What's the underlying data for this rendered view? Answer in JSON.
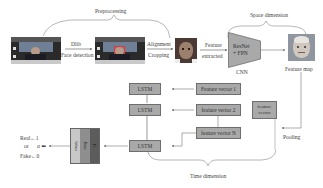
{
  "sections": {
    "preprocessing": "Preprocessing",
    "space_dimension": "Space dimension",
    "time_dimension": "Time dimension"
  },
  "steps": {
    "dlib_top": "Dlib",
    "dlib_bottom": "Face detection",
    "align_top": "Alignment",
    "align_bottom": "Cropping",
    "feature_top": "Feature",
    "feature_bottom": "extracted",
    "cnn_line1": "ResNet",
    "cnn_line2": "+ FPN",
    "cnn_label": "CNN",
    "feature_map": "Feature map",
    "pooling": "Pooling",
    "feature_vector": "feature vector"
  },
  "lstm": {
    "cells": [
      "LSTM",
      "LSTM",
      "LSTM"
    ]
  },
  "vectors": [
    "Feature vector 1",
    "feature vector 2",
    "feature vector N"
  ],
  "classifier": {
    "layers": [
      "Softmax",
      "Dense",
      "FC"
    ]
  },
  "output": {
    "real": "Real←1",
    "or": "or",
    "symbol": "α ⬅",
    "fake": "Fake←0"
  },
  "colors": {
    "box_fill": "#a9a9a9",
    "box_border": "#6e6e6e",
    "line": "#7a7a7a",
    "layer1": "#c8c8c8",
    "layer2": "#8e8e8e",
    "layer3": "#5c5c5c"
  }
}
